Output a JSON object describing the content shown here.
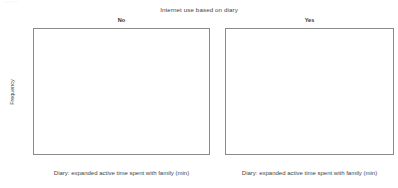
{
  "figure": {
    "title": "Internet use based on diary",
    "xlabel": "Diary: expanded active time spent with family (min)",
    "ylabel": "Frequency"
  },
  "panels": [
    {
      "strip_label": "No"
    },
    {
      "strip_label": "Yes"
    }
  ],
  "axis": {
    "y_ticks": [
      "0",
      "50",
      "100",
      "150",
      "200",
      "250"
    ],
    "x_ticks": [
      "0",
      "200",
      "400",
      "600",
      "800",
      "1000",
      "1200",
      "1400"
    ]
  },
  "chart_data": {
    "type": "bar",
    "title": "Internet use based on diary",
    "xlabel": "Diary: expanded active time spent with family (min)",
    "ylabel": "Frequency",
    "xlim": [
      -60,
      1560
    ],
    "ylim": [
      0,
      262
    ],
    "x_ticks": [
      0,
      200,
      400,
      600,
      800,
      1000,
      1200,
      1400
    ],
    "y_ticks": [
      0,
      50,
      100,
      150,
      200,
      250
    ],
    "grid": false,
    "legend": "none",
    "facet_variable": "Internet use based on diary",
    "bin_width": 50,
    "panels": [
      {
        "label": "No",
        "bin_starts": [
          0,
          50,
          100,
          150,
          200,
          250,
          300,
          350,
          400,
          450,
          500,
          550,
          600,
          650,
          700,
          750,
          800,
          850,
          900,
          950,
          1000,
          1050,
          1100,
          1150,
          1200,
          1250,
          1300,
          1350,
          1400,
          1450
        ],
        "values": [
          212,
          16,
          18,
          100,
          46,
          21,
          19,
          25,
          42,
          40,
          18,
          15,
          10,
          30,
          19,
          17,
          11,
          10,
          4,
          11,
          2,
          7,
          0,
          0,
          0,
          1,
          0,
          0,
          0,
          0
        ]
      },
      {
        "label": "Yes",
        "bin_starts": [
          0,
          50,
          100,
          150,
          200,
          250,
          300,
          350,
          400,
          450,
          500,
          550,
          600,
          650,
          700,
          750,
          800,
          850,
          900,
          950,
          1000,
          1050,
          1100,
          1150,
          1200,
          1250,
          1300,
          1350,
          1400,
          1450
        ],
        "values": [
          44,
          4,
          4,
          9,
          4,
          1,
          1,
          11,
          9,
          2,
          1,
          3,
          2,
          1,
          0,
          0,
          0,
          0,
          0,
          0,
          0,
          0,
          0,
          0,
          0,
          0,
          0,
          0,
          0,
          0
        ]
      }
    ]
  }
}
